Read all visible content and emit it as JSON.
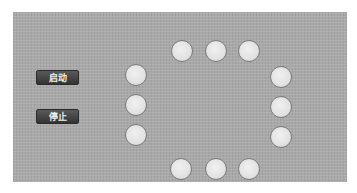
{
  "panel": {
    "background_color": "#a9a9a9"
  },
  "controls": {
    "start_label": "启动",
    "stop_label": "停止"
  },
  "lamps": {
    "count": 12,
    "state": "off",
    "color_off": "#e2e2e2",
    "items": [
      {
        "id": 1,
        "position": "top-1"
      },
      {
        "id": 2,
        "position": "top-2"
      },
      {
        "id": 3,
        "position": "top-3"
      },
      {
        "id": 4,
        "position": "right-1"
      },
      {
        "id": 5,
        "position": "right-2"
      },
      {
        "id": 6,
        "position": "right-3"
      },
      {
        "id": 7,
        "position": "bottom-3"
      },
      {
        "id": 8,
        "position": "bottom-2"
      },
      {
        "id": 9,
        "position": "bottom-1"
      },
      {
        "id": 10,
        "position": "left-3"
      },
      {
        "id": 11,
        "position": "left-2"
      },
      {
        "id": 12,
        "position": "left-1"
      }
    ]
  }
}
